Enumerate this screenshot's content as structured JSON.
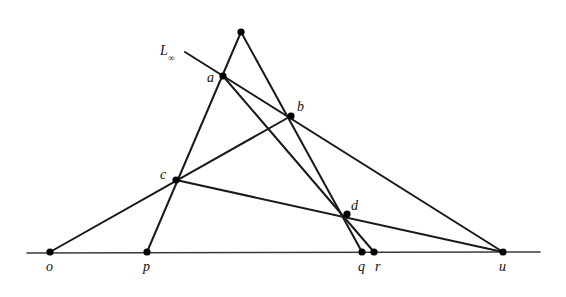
{
  "figure": {
    "domain": "diagram",
    "width": 566,
    "height": 297,
    "background_color": "#ffffff",
    "stroke_color": "#1a1a1a",
    "baseline_color": "#3a3a3a"
  },
  "labels": {
    "o": "o",
    "p": "p",
    "q": "q",
    "r": "r",
    "u": "u",
    "a": "a",
    "b": "b",
    "c": "c",
    "d": "d",
    "line_at_infinity": "L",
    "line_at_infinity_subscript": "∞"
  },
  "points": [
    {
      "id": "o",
      "label": "o",
      "x": 50,
      "y": 252,
      "on_baseline": true,
      "label_dx": -4,
      "label_dy": 8
    },
    {
      "id": "p",
      "label": "p",
      "x": 147,
      "y": 252,
      "on_baseline": true,
      "label_dx": -4,
      "label_dy": 8
    },
    {
      "id": "q",
      "label": "q",
      "x": 362,
      "y": 252,
      "on_baseline": true,
      "label_dx": -4,
      "label_dy": 8
    },
    {
      "id": "r",
      "label": "r",
      "x": 374,
      "y": 252,
      "on_baseline": true,
      "label_dx": 1,
      "label_dy": 8
    },
    {
      "id": "u",
      "label": "u",
      "x": 503,
      "y": 252,
      "on_baseline": true,
      "label_dx": -4,
      "label_dy": 8
    },
    {
      "id": "v",
      "label": "",
      "x": 241,
      "y": 32,
      "on_baseline": false,
      "label_dx": 0,
      "label_dy": 0
    },
    {
      "id": "a",
      "label": "a",
      "x": 223,
      "y": 76,
      "on_baseline": false,
      "label_dx": -16,
      "label_dy": -5
    },
    {
      "id": "b",
      "label": "b",
      "x": 291,
      "y": 116,
      "on_baseline": false,
      "label_dx": 6,
      "label_dy": -16
    },
    {
      "id": "c",
      "label": "c",
      "x": 176,
      "y": 180,
      "on_baseline": false,
      "label_dx": -16,
      "label_dy": -12
    },
    {
      "id": "d",
      "label": "d",
      "x": 347,
      "y": 214,
      "on_baseline": false,
      "label_dx": 4,
      "label_dy": -15
    }
  ],
  "segments": [
    {
      "id": "baseline",
      "from": [
        27,
        253
      ],
      "to": [
        540,
        252
      ],
      "kind": "baseline"
    },
    {
      "id": "Linf-a-b-u",
      "from": [
        185,
        52
      ],
      "to": [
        503,
        252
      ],
      "kind": "ray"
    },
    {
      "id": "p-c-a-v",
      "from": [
        147,
        252
      ],
      "to": [
        241,
        32
      ],
      "kind": "ray"
    },
    {
      "id": "o-c-b",
      "from": [
        50,
        252
      ],
      "to": [
        291,
        116
      ],
      "kind": "ray"
    },
    {
      "id": "c-d-u",
      "from": [
        176,
        180
      ],
      "to": [
        503,
        252
      ],
      "kind": "ray"
    },
    {
      "id": "v-b-d-q",
      "from": [
        241,
        32
      ],
      "to": [
        362,
        252
      ],
      "kind": "ray"
    },
    {
      "id": "a-d-r",
      "from": [
        223,
        76
      ],
      "to": [
        374,
        252
      ],
      "kind": "ray"
    }
  ],
  "line_label": {
    "text": "L",
    "subscript": "∞",
    "x": 160,
    "y": 44
  }
}
